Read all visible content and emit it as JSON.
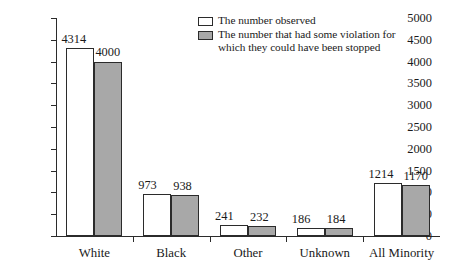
{
  "chart_data": {
    "type": "bar",
    "title": "",
    "subtitle": "",
    "xlabel": "",
    "ylabel": "",
    "categories": [
      "White",
      "Black",
      "Other",
      "Unknown",
      "All Minority"
    ],
    "series": [
      {
        "name": "The number observed",
        "color": "#ffffff",
        "border_color": "#2b2b2b",
        "values": [
          4314,
          973,
          241,
          186,
          1214
        ]
      },
      {
        "name": "The number that had some violation for\nwhich they could have been stopped",
        "color": "#a8a8a8",
        "border_color": "#2b2b2b",
        "values": [
          4000,
          938,
          232,
          184,
          1170
        ]
      }
    ],
    "ylim": [
      0,
      5000
    ],
    "ytick_step": 500,
    "ytick_labels": [
      "5000",
      "4500",
      "4000",
      "3500",
      "3000",
      "2500",
      "2000",
      "1500",
      "1000",
      "500",
      "0"
    ],
    "grid": false,
    "legend_position": "top-right",
    "data_labels_shown": true
  },
  "legend": {
    "entries": [
      {
        "label": "The number observed",
        "swatch": "white-swatch"
      },
      {
        "label": "The number that had some violation for\nwhich they could have been stopped",
        "swatch": "gray-swatch"
      }
    ]
  },
  "axis": {
    "y_ticks": [
      "5000",
      "4500",
      "4000",
      "3500",
      "3000",
      "2500",
      "2000",
      "1500",
      "1000",
      "500",
      "0"
    ],
    "x_categories": [
      "White",
      "Black",
      "Other",
      "Unknown",
      "All Minority"
    ]
  },
  "bar_labels": {
    "white": {
      "observed": "4314",
      "violation": "4000"
    },
    "black": {
      "observed": "973",
      "violation": "938"
    },
    "other": {
      "observed": "241",
      "violation": "232"
    },
    "unknown": {
      "observed": "186",
      "violation": "184"
    },
    "all_minority": {
      "observed": "1214",
      "violation": "1170"
    }
  }
}
